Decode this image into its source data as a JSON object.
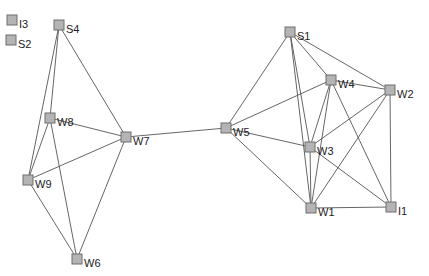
{
  "graph": {
    "nodes": [
      {
        "id": "I3",
        "label": "I3",
        "x": 12,
        "y": 20
      },
      {
        "id": "S2",
        "label": "S2",
        "x": 11,
        "y": 40
      },
      {
        "id": "S4",
        "label": "S4",
        "x": 59,
        "y": 25
      },
      {
        "id": "W8",
        "label": "W8",
        "x": 50,
        "y": 118
      },
      {
        "id": "W7",
        "label": "W7",
        "x": 126,
        "y": 137
      },
      {
        "id": "W9",
        "label": "W9",
        "x": 28,
        "y": 180
      },
      {
        "id": "W6",
        "label": "W6",
        "x": 77,
        "y": 259
      },
      {
        "id": "W5",
        "label": "W5",
        "x": 226,
        "y": 128
      },
      {
        "id": "S1",
        "label": "S1",
        "x": 290,
        "y": 32
      },
      {
        "id": "W4",
        "label": "W4",
        "x": 331,
        "y": 80
      },
      {
        "id": "W2",
        "label": "W2",
        "x": 390,
        "y": 90
      },
      {
        "id": "W3",
        "label": "W3",
        "x": 310,
        "y": 147
      },
      {
        "id": "W1",
        "label": "W1",
        "x": 311,
        "y": 208
      },
      {
        "id": "I1",
        "label": "I1",
        "x": 391,
        "y": 207
      }
    ],
    "edges": [
      [
        "S4",
        "W8"
      ],
      [
        "S4",
        "W9"
      ],
      [
        "S4",
        "W7"
      ],
      [
        "W8",
        "W7"
      ],
      [
        "W8",
        "W9"
      ],
      [
        "W8",
        "W6"
      ],
      [
        "W9",
        "W7"
      ],
      [
        "W9",
        "W6"
      ],
      [
        "W7",
        "W6"
      ],
      [
        "W7",
        "W5"
      ],
      [
        "W5",
        "S1"
      ],
      [
        "W5",
        "W4"
      ],
      [
        "W5",
        "W3"
      ],
      [
        "W5",
        "W1"
      ],
      [
        "S1",
        "W4"
      ],
      [
        "S1",
        "W2"
      ],
      [
        "S1",
        "W3"
      ],
      [
        "S1",
        "W1"
      ],
      [
        "W4",
        "W2"
      ],
      [
        "W4",
        "W3"
      ],
      [
        "W4",
        "W1"
      ],
      [
        "W4",
        "I1"
      ],
      [
        "W2",
        "W3"
      ],
      [
        "W2",
        "W1"
      ],
      [
        "W2",
        "I1"
      ],
      [
        "W3",
        "W1"
      ],
      [
        "W3",
        "I1"
      ],
      [
        "W1",
        "I1"
      ]
    ]
  }
}
